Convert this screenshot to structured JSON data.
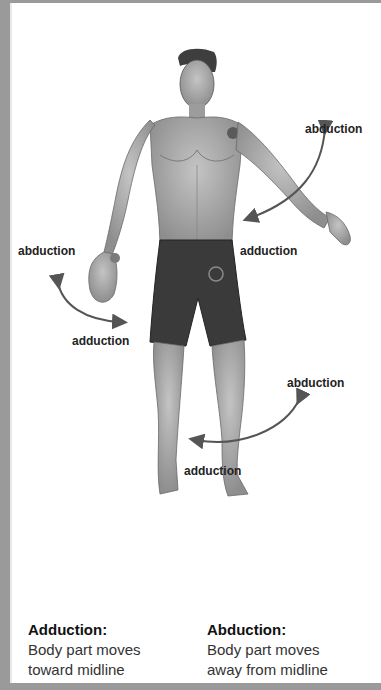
{
  "diagram": {
    "labels": {
      "shoulder_abduction": "abduction",
      "shoulder_adduction": "adduction",
      "wrist_abduction": "abduction",
      "wrist_adduction": "adduction",
      "hip_abduction": "abduction",
      "hip_adduction": "adduction"
    },
    "colors": {
      "frame": "#9a9a9a",
      "arrow": "#555555",
      "skin": "#a8a8a8",
      "shorts": "#3a3a3a",
      "joint_marker": "#555555"
    }
  },
  "legend": {
    "adduction": {
      "title": "Adduction:",
      "line1": "Body part moves",
      "line2": "toward midline"
    },
    "abduction": {
      "title": "Abduction:",
      "line1": "Body part moves",
      "line2": "away from midline"
    }
  }
}
